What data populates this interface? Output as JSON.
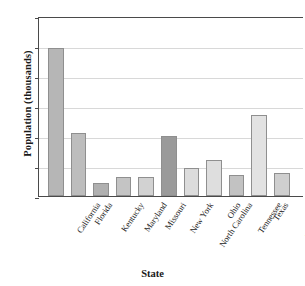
{
  "chart_data": {
    "type": "bar",
    "title": "",
    "xlabel": "State",
    "ylabel": "Population (thousands)",
    "ylim": [
      0,
      60000
    ],
    "yticks": [
      0,
      10000,
      20000,
      30000,
      40000,
      50000,
      60000
    ],
    "ytick_labels": [
      "0",
      "10,000",
      "20,000",
      "30,000",
      "40,000",
      "50,000",
      "60,000"
    ],
    "grid": true,
    "legend": "none",
    "categories": [
      "California",
      "Florida",
      "Kentucky",
      "Maryland",
      "Missouri",
      "New York",
      "North Carolina",
      "Ohio",
      "Tennessee",
      "Texas",
      "Washington"
    ],
    "values": [
      49500,
      21000,
      4300,
      6300,
      6500,
      20000,
      9400,
      11900,
      7000,
      27000,
      7700
    ],
    "bar_colors": [
      "#b6b6b6",
      "#bdbdbd",
      "#b0b0b0",
      "#c4c4c4",
      "#d2d2d2",
      "#9a9a9a",
      "#dcdcdc",
      "#dedede",
      "#c2c2c2",
      "#e2e2e2",
      "#cfcfcf"
    ],
    "bars": [
      {
        "label": "California",
        "value": 49500,
        "color": "#b6b6b6"
      },
      {
        "label": "Florida",
        "value": 21000,
        "color": "#bdbdbd"
      },
      {
        "label": "Kentucky",
        "value": 4300,
        "color": "#b0b0b0"
      },
      {
        "label": "Maryland",
        "value": 6300,
        "color": "#c4c4c4"
      },
      {
        "label": "Missouri",
        "value": 6500,
        "color": "#d2d2d2"
      },
      {
        "label": "New York",
        "value": 20000,
        "color": "#9a9a9a"
      },
      {
        "label": "North Carolina",
        "value": 9400,
        "color": "#dcdcdc"
      },
      {
        "label": "Ohio",
        "value": 11900,
        "color": "#dedede"
      },
      {
        "label": "Tennessee",
        "value": 7000,
        "color": "#c2c2c2"
      },
      {
        "label": "Texas",
        "value": 27000,
        "color": "#e2e2e2"
      },
      {
        "label": "Washington",
        "value": 7700,
        "color": "#cfcfcf"
      }
    ]
  },
  "axis_color": "#4a4a4a",
  "grid_color": "#d8d8d8"
}
